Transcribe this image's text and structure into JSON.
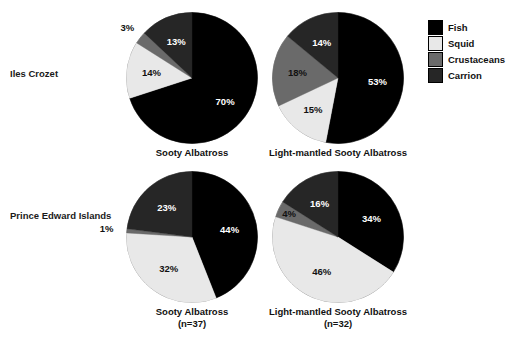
{
  "chart_data": {
    "type": "pie",
    "title": "",
    "legend": {
      "position": "right",
      "entries": [
        {
          "label": "Fish",
          "color": "#000000"
        },
        {
          "label": "Squid",
          "color": "#e8e8e8"
        },
        {
          "label": "Crustaceans",
          "color": "#6a6a6a"
        },
        {
          "label": "Carrion",
          "color": "#262626"
        }
      ]
    },
    "categories": [
      "Fish",
      "Squid",
      "Crustaceans",
      "Carrion"
    ],
    "row_labels": [
      "Iles Crozet",
      "Prince Edward Islands"
    ],
    "column_labels": [
      "Sooty Albatross",
      "Light-mantled Sooty Albatross"
    ],
    "panels": [
      {
        "row": "Iles Crozet",
        "species": "Sooty Albatross",
        "sample_size": "",
        "caption": "Sooty Albatross",
        "caption_sub": "",
        "values": [
          70,
          14,
          3,
          13
        ],
        "labels": [
          "70%",
          "14%",
          "3%",
          "13%"
        ]
      },
      {
        "row": "Iles Crozet",
        "species": "Light-mantled Sooty Albatross",
        "sample_size": "",
        "caption": "Light-mantled Sooty Albatross",
        "caption_sub": "",
        "values": [
          53,
          15,
          18,
          14
        ],
        "labels": [
          "53%",
          "15%",
          "18%",
          "14%"
        ]
      },
      {
        "row": "Prince Edward Islands",
        "species": "Sooty Albatross",
        "sample_size": "(n=37)",
        "caption": "Sooty Albatross",
        "caption_sub": "(n=37)",
        "values": [
          44,
          32,
          1,
          23
        ],
        "labels": [
          "44%",
          "32%",
          "1%",
          "23%"
        ]
      },
      {
        "row": "Prince Edward Islands",
        "species": "Light-mantled Sooty Albatross",
        "sample_size": "(n=32)",
        "caption": "Light-mantled Sooty Albatross",
        "caption_sub": "(n=32)",
        "values": [
          34,
          46,
          4,
          16
        ],
        "labels": [
          "34%",
          "46%",
          "4%",
          "16%"
        ]
      }
    ]
  },
  "colors": {
    "fish": "#000000",
    "squid": "#e8e8e8",
    "crustaceans": "#6a6a6a",
    "carrion": "#262626",
    "outline": "#9a9a9a",
    "background": "#ffffff",
    "text": "#111111"
  },
  "layout": {
    "pies": [
      {
        "cx": 192,
        "cy": 78,
        "r": 66,
        "caption_y": 147
      },
      {
        "cx": 338,
        "cy": 78,
        "r": 66,
        "caption_y": 147
      },
      {
        "cx": 192,
        "cy": 237,
        "r": 66,
        "caption_y": 306
      },
      {
        "cx": 338,
        "cy": 237,
        "r": 66,
        "caption_y": 306
      }
    ],
    "label_radius_frac": [
      0.6,
      0.62,
      1.22,
      0.62
    ],
    "label_radius_frac_p2": [
      0.6,
      0.62,
      1.28,
      0.6
    ],
    "label_radius_frac_p3": [
      0.58,
      0.6,
      0.8,
      0.58
    ]
  }
}
